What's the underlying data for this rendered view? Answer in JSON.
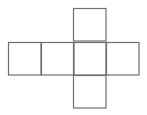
{
  "diagram": {
    "type": "cube-net",
    "stroke_color": "#6e6e6e",
    "background": "#ffffff",
    "cell_size": 32.5,
    "faces": [
      {
        "id": "top",
        "x": 73,
        "y": 8
      },
      {
        "id": "left-1",
        "x": 8,
        "y": 42
      },
      {
        "id": "left-2",
        "x": 41,
        "y": 42
      },
      {
        "id": "center",
        "x": 73,
        "y": 42
      },
      {
        "id": "right",
        "x": 106,
        "y": 42
      },
      {
        "id": "bottom",
        "x": 73,
        "y": 75
      }
    ]
  }
}
